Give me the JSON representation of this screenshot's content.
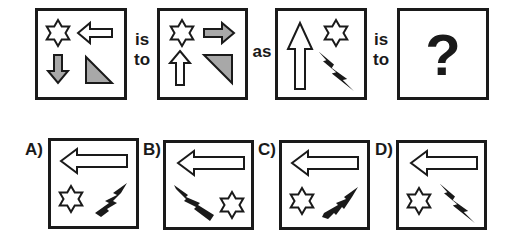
{
  "puzzle": {
    "connectors": {
      "first": {
        "line1": "is",
        "line2": "to"
      },
      "middle": "as",
      "second": {
        "line1": "is",
        "line2": "to"
      }
    },
    "question_mark": "?",
    "top_boxes": [
      {
        "id": "box-1",
        "shapes": [
          "star-outline top-left",
          "left-arrow-outline top-right",
          "down-arrow-gray bottom-left",
          "right-triangle-gray bottom-right"
        ]
      },
      {
        "id": "box-2",
        "shapes": [
          "star-outline top-left",
          "right-arrow-gray top-right",
          "up-arrow-outline bottom-left",
          "inverted-triangle-gray bottom-right"
        ]
      },
      {
        "id": "box-3",
        "shapes": [
          "up-arrow-outline tall left",
          "star-outline top-right",
          "lightning-black bottom-right"
        ]
      },
      {
        "id": "box-4",
        "shapes": [
          "question-mark"
        ]
      }
    ],
    "options": [
      {
        "label": "A)",
        "shapes": [
          "left-arrow-outline top",
          "star-outline bottom-left",
          "lightning-black bottom-right pointing up-right"
        ]
      },
      {
        "label": "B)",
        "shapes": [
          "left-arrow-outline top",
          "lightning-black bottom-left pointing down-right",
          "star-outline bottom-right"
        ]
      },
      {
        "label": "C)",
        "shapes": [
          "left-arrow-outline top",
          "star-outline bottom-left",
          "lightning-black bottom-right diagonal up-right"
        ]
      },
      {
        "label": "D)",
        "shapes": [
          "left-arrow-outline top",
          "star-outline bottom-left",
          "lightning-black bottom-right pointing down-right"
        ]
      }
    ],
    "colors": {
      "stroke": "#1a1a1a",
      "gray_fill": "#a8a8a8",
      "black_fill": "#1a1a1a",
      "background": "#ffffff"
    }
  }
}
